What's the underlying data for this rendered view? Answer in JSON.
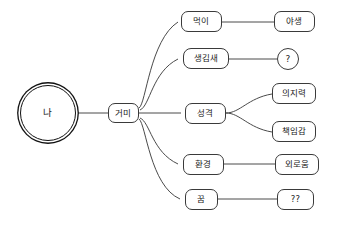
{
  "diagram": {
    "colors": {
      "background": "#ffffff",
      "node_border": "#3a3a3a",
      "root_border": "#111111",
      "edge": "#4a4a4a",
      "text": "#1a1a1a"
    },
    "root": {
      "label": "나",
      "shape": "double-circle"
    },
    "level1": {
      "label": "거미",
      "shape": "rounded-rect"
    },
    "branches": [
      {
        "label": "먹이",
        "shape": "rounded-rect",
        "children": [
          {
            "label": "야생",
            "shape": "rounded-rect"
          }
        ]
      },
      {
        "label": "생김새",
        "shape": "rounded-rect",
        "children": [
          {
            "label": "?",
            "shape": "circle"
          }
        ]
      },
      {
        "label": "성격",
        "shape": "rounded-rect",
        "children": [
          {
            "label": "의지력",
            "shape": "rounded-rect"
          },
          {
            "label": "책임감",
            "shape": "rounded-rect"
          }
        ]
      },
      {
        "label": "환경",
        "shape": "rounded-rect",
        "children": [
          {
            "label": "외로움",
            "shape": "rounded-rect"
          }
        ]
      },
      {
        "label": "꿈",
        "shape": "rounded-rect",
        "children": [
          {
            "label": "??",
            "shape": "rounded-rect"
          }
        ]
      }
    ]
  }
}
